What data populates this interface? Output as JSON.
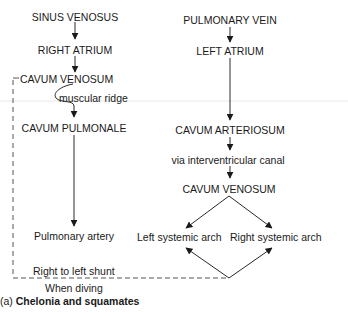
{
  "diagram": {
    "left_column": {
      "sinus_venosus": "SINUS VENOSUS",
      "right_atrium": "RIGHT ATRIUM",
      "cavum_venosum": "CAVUM VENOSUM",
      "muscular_ridge": "muscular ridge",
      "cavum_pulmonale": "CAVUM PULMONALE",
      "pulmonary_artery": "Pulmonary artery"
    },
    "right_column": {
      "pulmonary_vein": "PULMONARY VEIN",
      "left_atrium": "LEFT ATRIUM",
      "cavum_arteriosum": "CAVUM ARTERIOSUM",
      "via_canal": "via interventricular canal",
      "cavum_venosum": "CAVUM VENOSUM",
      "left_systemic_arch": "Left systemic arch",
      "right_systemic_arch": "Right systemic arch"
    },
    "shunt": {
      "label": "Right to left shunt",
      "condition": "When diving"
    },
    "caption": {
      "prefix": "(a)",
      "title": "Chelonia and squamates"
    },
    "colors": {
      "line": "#2a2a2a",
      "dashed": "#555555",
      "artifact": "#e6e6e6"
    }
  }
}
